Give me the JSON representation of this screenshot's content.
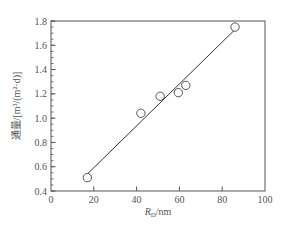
{
  "chart_data": {
    "type": "scatter",
    "title": "",
    "xlabel": "R_D/nm",
    "xlabel_main": "R",
    "xlabel_sub": "D",
    "xlabel_unit": "/nm",
    "ylabel": "通量/[m³/(m²·d)]",
    "xlim": [
      0,
      100
    ],
    "ylim": [
      0.4,
      1.8
    ],
    "x_ticks": [
      0,
      20,
      40,
      60,
      80,
      100
    ],
    "x_tick_labels": [
      "0",
      "20",
      "40",
      "60",
      "80",
      "100"
    ],
    "y_ticks": [
      0.4,
      0.6,
      0.8,
      1.0,
      1.2,
      1.4,
      1.6,
      1.8
    ],
    "y_tick_labels": [
      "0.4",
      "0.6",
      "0.8",
      "1.0",
      "1.2",
      "1.4",
      "1.6",
      "1.8"
    ],
    "y_minor_step": 0.05,
    "grid": false,
    "legend": null,
    "series": [
      {
        "name": "measured",
        "marker": "open-circle",
        "x": [
          17,
          42,
          51,
          59.5,
          63,
          86
        ],
        "y": [
          0.51,
          1.04,
          1.18,
          1.21,
          1.27,
          1.75
        ]
      },
      {
        "name": "linear fit",
        "style": "line",
        "x": [
          17,
          86
        ],
        "y": [
          0.54,
          1.73
        ]
      }
    ]
  },
  "colors": {
    "axis": "#555555",
    "marker": "#444444",
    "line": "#333333",
    "text": "#555555"
  }
}
